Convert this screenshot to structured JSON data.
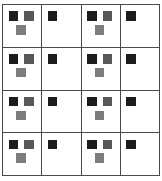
{
  "canvas": {
    "width": 162,
    "height": 181,
    "background": "#ffffff"
  },
  "grid": {
    "rows": 4,
    "columns": 4,
    "line_color": "#4a4a4a",
    "line_width": 1,
    "cell_background": "#ffffff",
    "left": 2,
    "top": 4,
    "width": 158,
    "height": 172
  },
  "palette": {
    "black_square": "#1c1c1c",
    "dark_gray_square": "#585858",
    "medium_gray_square": "#7d7d7d",
    "border": "#4a4a4a",
    "background": "#ffffff"
  },
  "marker_types": {
    "triple": {
      "label": "triple-marker",
      "count": 3,
      "squares": [
        {
          "position": "top-left",
          "color": "#1c1c1c",
          "shade": "black"
        },
        {
          "position": "top-right",
          "color": "#585858",
          "shade": "dark-gray"
        },
        {
          "position": "bottom-center",
          "color": "#7d7d7d",
          "shade": "medium-gray"
        }
      ]
    },
    "single": {
      "label": "single-marker",
      "count": 1,
      "squares": [
        {
          "position": "top-left",
          "color": "#1c1c1c",
          "shade": "black"
        }
      ]
    }
  },
  "cells": [
    [
      {
        "type": "triple"
      },
      {
        "type": "single"
      },
      {
        "type": "triple"
      },
      {
        "type": "single"
      }
    ],
    [
      {
        "type": "triple"
      },
      {
        "type": "single"
      },
      {
        "type": "triple"
      },
      {
        "type": "single"
      }
    ],
    [
      {
        "type": "triple"
      },
      {
        "type": "single"
      },
      {
        "type": "triple"
      },
      {
        "type": "single"
      }
    ],
    [
      {
        "type": "triple"
      },
      {
        "type": "single"
      },
      {
        "type": "triple"
      },
      {
        "type": "single"
      }
    ]
  ]
}
